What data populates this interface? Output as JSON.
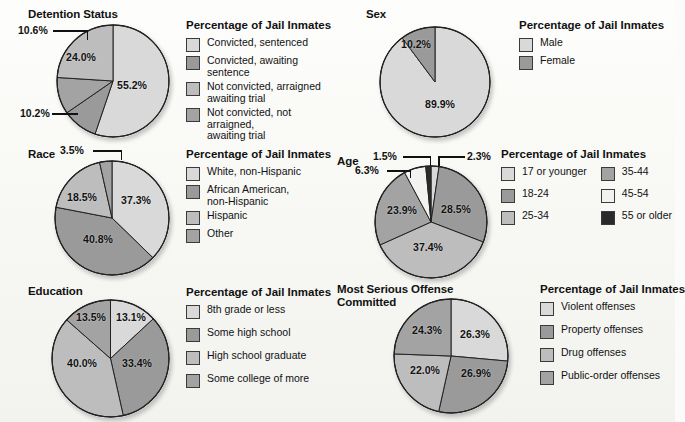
{
  "figure": {
    "background": "#fbfbf9",
    "legend_title": "Percentage of Jail Inmates"
  },
  "palette": {
    "l1": "#d9d9d9",
    "l2": "#9a9a9a",
    "l3": "#bdbdbd",
    "l4": "#a8a8a8",
    "white": "#f2f2f0",
    "black": "#2a2a2a"
  },
  "panels": {
    "detention": {
      "title": "Detention Status",
      "legend_title": "Percentage of Jail Inmates",
      "labels": [
        "55.2%",
        "10.2%",
        "24.0%",
        "10.6%"
      ],
      "legend": [
        {
          "label": "Convicted, sentenced",
          "color": "#d9d9d9"
        },
        {
          "label": "Convicted, awaiting sentence",
          "color": "#9a9a9a"
        },
        {
          "label": "Not convicted, arraigned\nawaiting trial",
          "color": "#bdbdbd"
        },
        {
          "label": "Not convicted, not arraigned,\nawaiting trial",
          "color": "#a3a3a3"
        }
      ]
    },
    "race": {
      "title": "Race",
      "legend_title": "Percentage of Jail Inmates",
      "labels": [
        "37.3%",
        "40.8%",
        "18.5%",
        "3.5%"
      ],
      "legend": [
        {
          "label": "White, non-Hispanic",
          "color": "#d9d9d9"
        },
        {
          "label": "African American,\nnon-Hispanic",
          "color": "#9a9a9a"
        },
        {
          "label": "Hispanic",
          "color": "#bdbdbd"
        },
        {
          "label": "Other",
          "color": "#a3a3a3"
        }
      ]
    },
    "education": {
      "title": "Education",
      "legend_title": "Percentage of Jail Inmates",
      "labels": [
        "13.1%",
        "33.4%",
        "40.0%",
        "13.5%"
      ],
      "legend": [
        {
          "label": "8th grade or less",
          "color": "#d9d9d9"
        },
        {
          "label": "Some high school",
          "color": "#9a9a9a"
        },
        {
          "label": "High school graduate",
          "color": "#bdbdbd"
        },
        {
          "label": "Some college of more",
          "color": "#a3a3a3"
        }
      ]
    },
    "sex": {
      "title": "Sex",
      "legend_title": "Percentage of Jail Inmates",
      "labels": [
        "89.9%",
        "10.2%"
      ],
      "legend": [
        {
          "label": "Male",
          "color": "#d9d9d9"
        },
        {
          "label": "Female",
          "color": "#9a9a9a"
        }
      ]
    },
    "age": {
      "title": "Age",
      "legend_title": "Percentage of Jail Inmates",
      "labels": [
        "2.3%",
        "28.5%",
        "37.4%",
        "23.9%",
        "6.3%",
        "1.5%"
      ],
      "legend_left": [
        {
          "label": "17 or younger",
          "color": "#d9d9d9"
        },
        {
          "label": "18-24",
          "color": "#9a9a9a"
        },
        {
          "label": "25-34",
          "color": "#bdbdbd"
        }
      ],
      "legend_right": [
        {
          "label": "35-44",
          "color": "#a3a3a3"
        },
        {
          "label": "45-54",
          "color": "#f2f2f0"
        },
        {
          "label": "55 or older",
          "color": "#2a2a2a"
        }
      ]
    },
    "offense": {
      "title": "Most Serious Offense\nCommitted",
      "legend_title": "Percentage of Jail Inmates",
      "labels": [
        "26.3%",
        "26.9%",
        "22.0%",
        "24.3%"
      ],
      "legend": [
        {
          "label": "Violent offenses",
          "color": "#d9d9d9"
        },
        {
          "label": "Property offenses",
          "color": "#9a9a9a"
        },
        {
          "label": "Drug offenses",
          "color": "#bdbdbd"
        },
        {
          "label": "Public-order offenses",
          "color": "#a3a3a3"
        }
      ]
    }
  },
  "chart_data": [
    {
      "type": "pie",
      "title": "Detention Status",
      "ylabel": "Percentage of Jail Inmates",
      "categories": [
        "Convicted, sentenced",
        "Convicted, awaiting sentence",
        "Not convicted, arraigned awaiting trial",
        "Not convicted, not arraigned, awaiting trial"
      ],
      "values": [
        55.2,
        10.2,
        24.0,
        10.6
      ],
      "colors": [
        "#d9d9d9",
        "#9a9a9a",
        "#bdbdbd",
        "#a3a3a3"
      ],
      "legend_position": "right"
    },
    {
      "type": "pie",
      "title": "Sex",
      "ylabel": "Percentage of Jail Inmates",
      "categories": [
        "Male",
        "Female"
      ],
      "values": [
        89.9,
        10.2
      ],
      "colors": [
        "#d9d9d9",
        "#9a9a9a"
      ],
      "legend_position": "right"
    },
    {
      "type": "pie",
      "title": "Race",
      "ylabel": "Percentage of Jail Inmates",
      "categories": [
        "White, non-Hispanic",
        "African American, non-Hispanic",
        "Hispanic",
        "Other"
      ],
      "values": [
        37.3,
        40.8,
        18.5,
        3.5
      ],
      "colors": [
        "#d9d9d9",
        "#9a9a9a",
        "#bdbdbd",
        "#a3a3a3"
      ],
      "legend_position": "right"
    },
    {
      "type": "pie",
      "title": "Age",
      "ylabel": "Percentage of Jail Inmates",
      "categories": [
        "17 or younger",
        "18-24",
        "25-34",
        "35-44",
        "45-54",
        "55 or older"
      ],
      "values": [
        2.3,
        28.5,
        37.4,
        23.9,
        6.3,
        1.5
      ],
      "colors": [
        "#d9d9d9",
        "#9a9a9a",
        "#bdbdbd",
        "#a3a3a3",
        "#f2f2f0",
        "#2a2a2a"
      ],
      "legend_position": "right"
    },
    {
      "type": "pie",
      "title": "Education",
      "ylabel": "Percentage of Jail Inmates",
      "categories": [
        "8th grade or less",
        "Some high school",
        "High school graduate",
        "Some college of more"
      ],
      "values": [
        13.1,
        33.4,
        40.0,
        13.5
      ],
      "colors": [
        "#d9d9d9",
        "#9a9a9a",
        "#bdbdbd",
        "#a3a3a3"
      ],
      "legend_position": "right"
    },
    {
      "type": "pie",
      "title": "Most Serious Offense Committed",
      "ylabel": "Percentage of Jail Inmates",
      "categories": [
        "Violent offenses",
        "Property offenses",
        "Drug offenses",
        "Public-order offenses"
      ],
      "values": [
        26.3,
        26.9,
        22.0,
        24.3
      ],
      "colors": [
        "#d9d9d9",
        "#9a9a9a",
        "#bdbdbd",
        "#a3a3a3"
      ],
      "legend_position": "right"
    }
  ]
}
